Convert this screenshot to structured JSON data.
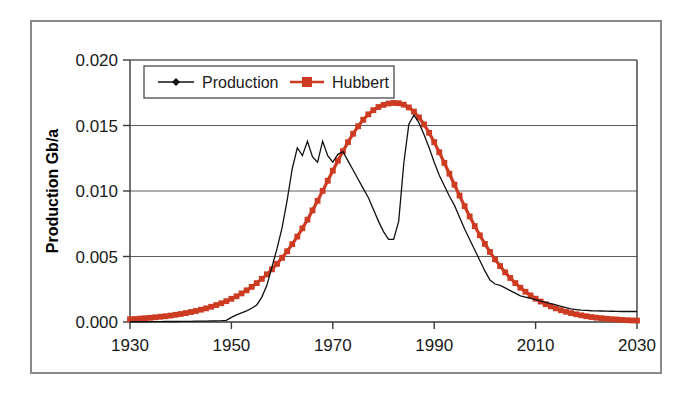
{
  "chart_data": {
    "type": "line",
    "title": "",
    "xlabel": "",
    "ylabel": "Production Gb/a",
    "xlim": [
      1930,
      2030
    ],
    "ylim": [
      0.0,
      0.02
    ],
    "grid": true,
    "legend_position": "top-left-inside",
    "x_ticks": [
      "1930",
      "1950",
      "1970",
      "1990",
      "2010",
      "2030"
    ],
    "x_tick_values": [
      1930,
      1950,
      1970,
      1990,
      2010,
      2030
    ],
    "y_ticks": [
      "0.000",
      "0.005",
      "0.010",
      "0.015",
      "0.020"
    ],
    "y_tick_values": [
      0.0,
      0.005,
      0.01,
      0.015,
      0.02
    ],
    "x": [
      1930,
      1931,
      1932,
      1933,
      1934,
      1935,
      1936,
      1937,
      1938,
      1939,
      1940,
      1941,
      1942,
      1943,
      1944,
      1945,
      1946,
      1947,
      1948,
      1949,
      1950,
      1951,
      1952,
      1953,
      1954,
      1955,
      1956,
      1957,
      1958,
      1959,
      1960,
      1961,
      1962,
      1963,
      1964,
      1965,
      1966,
      1967,
      1968,
      1969,
      1970,
      1971,
      1972,
      1973,
      1974,
      1975,
      1976,
      1977,
      1978,
      1979,
      1980,
      1981,
      1982,
      1983,
      1984,
      1985,
      1986,
      1987,
      1988,
      1989,
      1990,
      1991,
      1992,
      1993,
      1994,
      1995,
      1996,
      1997,
      1998,
      1999,
      2000,
      2001,
      2002,
      2003,
      2004,
      2005,
      2006,
      2007,
      2008,
      2009,
      2010,
      2011,
      2012,
      2013,
      2014,
      2015,
      2016,
      2017,
      2018,
      2019,
      2020,
      2021,
      2022,
      2023,
      2024,
      2025,
      2026,
      2027,
      2028,
      2029,
      2030
    ],
    "series": [
      {
        "name": "Production",
        "color": "#111111",
        "marker": "diamond",
        "values": [
          2e-05,
          2e-05,
          2e-05,
          2e-05,
          3e-05,
          3e-05,
          3e-05,
          4e-05,
          4e-05,
          4e-05,
          5e-05,
          5e-05,
          5e-05,
          6e-05,
          6e-05,
          7e-05,
          8e-05,
          9e-05,
          0.0001,
          0.00012,
          0.00035,
          0.00055,
          0.0007,
          0.00085,
          0.00105,
          0.0013,
          0.0019,
          0.0028,
          0.0042,
          0.0056,
          0.0072,
          0.0093,
          0.0117,
          0.0133,
          0.0127,
          0.0138,
          0.0126,
          0.0122,
          0.0138,
          0.0127,
          0.0122,
          0.0128,
          0.013,
          0.0123,
          0.0116,
          0.0109,
          0.0102,
          0.0095,
          0.0086,
          0.0077,
          0.0069,
          0.0063,
          0.0063,
          0.0077,
          0.0121,
          0.0151,
          0.0158,
          0.0152,
          0.0143,
          0.0133,
          0.0122,
          0.0112,
          0.0104,
          0.0096,
          0.0089,
          0.008,
          0.0071,
          0.0063,
          0.0055,
          0.0047,
          0.0039,
          0.0032,
          0.0029,
          0.0028,
          0.0026,
          0.0024,
          0.0022,
          0.002,
          0.0019,
          0.0018,
          0.0017,
          0.0016,
          0.0015,
          0.0014,
          0.0013,
          0.0012,
          0.0011,
          0.001,
          0.00095,
          0.0009,
          0.00088,
          0.00086,
          0.00085,
          0.00084,
          0.00083,
          0.00082,
          0.00081,
          0.0008,
          0.0008,
          0.0008,
          0.0008
        ]
      },
      {
        "name": "Hubbert",
        "color": "#cc3b22",
        "marker": "square",
        "values": [
          0.00021,
          0.00023,
          0.00026,
          0.00029,
          0.00032,
          0.00036,
          0.0004,
          0.00044,
          0.00049,
          0.00055,
          0.00061,
          0.00068,
          0.00076,
          0.00084,
          0.00094,
          0.00104,
          0.00116,
          0.00129,
          0.00143,
          0.00159,
          0.00177,
          0.00196,
          0.00218,
          0.00242,
          0.00268,
          0.00297,
          0.00329,
          0.00364,
          0.00402,
          0.00444,
          0.0049,
          0.0054,
          0.00594,
          0.00652,
          0.00715,
          0.00781,
          0.00852,
          0.00925,
          0.01001,
          0.01078,
          0.01155,
          0.01231,
          0.01304,
          0.01373,
          0.01437,
          0.01494,
          0.01544,
          0.01585,
          0.01617,
          0.01641,
          0.01657,
          0.01668,
          0.01672,
          0.0167,
          0.01659,
          0.01638,
          0.01606,
          0.01562,
          0.01508,
          0.01444,
          0.01373,
          0.01296,
          0.01215,
          0.01132,
          0.01048,
          0.00965,
          0.00884,
          0.00806,
          0.00732,
          0.00662,
          0.00596,
          0.00535,
          0.00478,
          0.00427,
          0.00379,
          0.00336,
          0.00297,
          0.00262,
          0.00231,
          0.00203,
          0.00178,
          0.00156,
          0.00136,
          0.00119,
          0.00104,
          0.0009,
          0.00078,
          0.00068,
          0.00059,
          0.00051,
          0.00044,
          0.00038,
          0.00033,
          0.00029,
          0.00025,
          0.00022,
          0.00019,
          0.00016,
          0.00014,
          0.00012,
          0.00011
        ]
      }
    ]
  },
  "legend": {
    "items": [
      {
        "label": "Production",
        "color": "#111111",
        "marker": "diamond"
      },
      {
        "label": "Hubbert",
        "color": "#cc3b22",
        "marker": "square"
      }
    ]
  },
  "axes": {
    "y_title": "Production Gb/a"
  }
}
